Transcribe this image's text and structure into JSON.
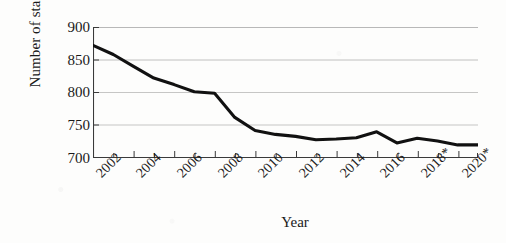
{
  "chart_data": {
    "type": "line",
    "title": "",
    "xlabel": "Year",
    "ylabel": "Number of staff",
    "ylim": [
      700,
      900
    ],
    "yticks": [
      900,
      850,
      800,
      750,
      700
    ],
    "xlim": [
      2002,
      2021
    ],
    "grid": true,
    "legend": null,
    "series_color": "#111111",
    "x": [
      2002,
      2003,
      2004,
      2005,
      2006,
      2007,
      2008,
      2009,
      2010,
      2011,
      2012,
      2013,
      2014,
      2015,
      2016,
      2017,
      2018,
      2019,
      2020,
      2021
    ],
    "xtick_labels": [
      "2002",
      "2004",
      "2006",
      "2008",
      "2010",
      "2012",
      "2014",
      "2016",
      "2018*",
      "2020*"
    ],
    "xtick_values": [
      2002,
      2004,
      2006,
      2008,
      2010,
      2012,
      2014,
      2016,
      2018,
      2020
    ],
    "series": [
      {
        "name": "Number of staff",
        "values": [
          872,
          858,
          840,
          822,
          812,
          801,
          799,
          762,
          742,
          736,
          733,
          728,
          729,
          731,
          740,
          723,
          730,
          726,
          720,
          720
        ]
      }
    ],
    "annotations": [
      "* denotes projected/estimated years 2018 and 2020"
    ]
  },
  "yticks": {
    "t0": "900",
    "t1": "850",
    "t2": "800",
    "t3": "750",
    "t4": "700"
  },
  "xticks": {
    "t0": "2002",
    "t1": "2004",
    "t2": "2006",
    "t3": "2008",
    "t4": "2010",
    "t5": "2012",
    "t6": "2014",
    "t7": "2016",
    "t8": "2018*",
    "t9": "2020*"
  },
  "axis_titles": {
    "y": "Number of staff",
    "x": "Year"
  }
}
